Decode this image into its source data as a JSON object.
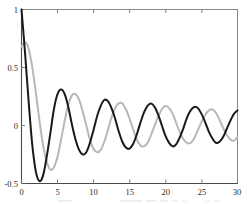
{
  "chart_data": {
    "type": "line",
    "title": "",
    "subtitle": "",
    "xlabel": "",
    "ylabel": "",
    "xlim": [
      0,
      30
    ],
    "ylim": [
      -0.5,
      1.0
    ],
    "grid": false,
    "legend": "none",
    "background": "#ffffff",
    "frame_color": "#8a8a8a",
    "xticks": [
      0,
      5,
      10,
      15,
      20,
      25,
      30
    ],
    "xtick_labels": [
      "0",
      "5",
      "10",
      "15",
      "20",
      "25",
      "30"
    ],
    "yticks": [
      -0.5,
      0,
      0.5,
      1
    ],
    "ytick_labels": [
      "-0.5",
      "0",
      "0.5",
      "1"
    ],
    "series": [
      {
        "name": "black-damped-oscillation",
        "color": "#1a1a1a",
        "width": 2.0,
        "x": [
          0,
          0.5,
          1,
          1.5,
          2,
          2.5,
          3,
          3.5,
          4,
          4.5,
          5,
          5.5,
          6,
          6.5,
          7,
          7.5,
          8,
          8.5,
          9,
          9.5,
          10,
          10.5,
          11,
          11.5,
          12,
          12.5,
          13,
          13.5,
          14,
          14.5,
          15,
          15.5,
          16,
          16.5,
          17,
          17.5,
          18,
          18.5,
          19,
          19.5,
          20,
          20.5,
          21,
          21.5,
          22,
          22.5,
          23,
          23.5,
          24,
          24.5,
          25,
          25.5,
          26,
          26.5,
          27,
          27.5,
          28,
          28.5,
          29,
          29.5,
          30
        ],
        "y": [
          1.0,
          0.62,
          0.2,
          -0.17,
          -0.4,
          -0.48,
          -0.43,
          -0.27,
          -0.07,
          0.14,
          0.27,
          0.31,
          0.27,
          0.16,
          0.01,
          -0.12,
          -0.21,
          -0.25,
          -0.23,
          -0.15,
          -0.04,
          0.08,
          0.17,
          0.22,
          0.21,
          0.15,
          0.06,
          -0.05,
          -0.14,
          -0.19,
          -0.2,
          -0.16,
          -0.08,
          0.02,
          0.11,
          0.17,
          0.19,
          0.16,
          0.09,
          0.0,
          -0.09,
          -0.15,
          -0.18,
          -0.16,
          -0.1,
          -0.02,
          0.07,
          0.13,
          0.16,
          0.15,
          0.1,
          0.03,
          -0.05,
          -0.11,
          -0.15,
          -0.14,
          -0.1,
          -0.03,
          0.04,
          0.1,
          0.13
        ]
      },
      {
        "name": "gray-damped-oscillation",
        "color": "#b8b8b8",
        "width": 2.0,
        "x": [
          0,
          0.5,
          1,
          1.5,
          2,
          2.5,
          3,
          3.5,
          4,
          4.5,
          5,
          5.5,
          6,
          6.5,
          7,
          7.5,
          8,
          8.5,
          9,
          9.5,
          10,
          10.5,
          11,
          11.5,
          12,
          12.5,
          13,
          13.5,
          14,
          14.5,
          15,
          15.5,
          16,
          16.5,
          17,
          17.5,
          18,
          18.5,
          19,
          19.5,
          20,
          20.5,
          21,
          21.5,
          22,
          22.5,
          23,
          23.5,
          24,
          24.5,
          25,
          25.5,
          26,
          26.5,
          27,
          27.5,
          28,
          28.5,
          29,
          29.5,
          30
        ],
        "y": [
          0.68,
          0.72,
          0.66,
          0.5,
          0.28,
          0.04,
          -0.17,
          -0.31,
          -0.38,
          -0.36,
          -0.27,
          -0.12,
          0.04,
          0.18,
          0.26,
          0.27,
          0.22,
          0.12,
          0.0,
          -0.12,
          -0.2,
          -0.23,
          -0.21,
          -0.14,
          -0.04,
          0.07,
          0.15,
          0.19,
          0.19,
          0.14,
          0.06,
          -0.03,
          -0.12,
          -0.17,
          -0.18,
          -0.15,
          -0.08,
          0.0,
          0.08,
          0.14,
          0.17,
          0.15,
          0.1,
          0.02,
          -0.06,
          -0.12,
          -0.15,
          -0.15,
          -0.11,
          -0.04,
          0.03,
          0.09,
          0.13,
          0.14,
          0.11,
          0.05,
          -0.02,
          -0.08,
          -0.12,
          -0.13,
          -0.1
        ]
      }
    ]
  },
  "axes": {
    "ytick_1": "1",
    "ytick_05": "0.5",
    "ytick_0": "0",
    "ytick_neg05": "-0.5",
    "xtick_0": "0",
    "xtick_5": "5",
    "xtick_10": "10",
    "xtick_15": "15",
    "xtick_20": "20",
    "xtick_25": "25",
    "xtick_30": "30"
  }
}
